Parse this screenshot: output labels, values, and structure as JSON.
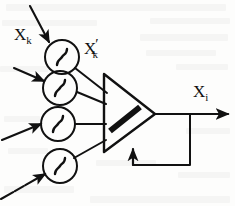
{
  "figure": {
    "kind": "diagram",
    "background_color": "#fdfdfc",
    "ink_color": "#111111"
  },
  "labels": {
    "input_signal": {
      "base": "X",
      "subscript": "k",
      "prime": ""
    },
    "activated_signal": {
      "base": "X",
      "subscript": "k",
      "prime": "′"
    },
    "output_signal": {
      "base": "X",
      "subscript": "i",
      "prime": ""
    }
  },
  "nodes": {
    "sigmoid_blocks": [
      {
        "id": "sigmoid-1",
        "symbol": "∫",
        "cx": 62,
        "cy": 57,
        "r": 17
      },
      {
        "id": "sigmoid-2",
        "symbol": "∫",
        "cx": 60,
        "cy": 88,
        "r": 17
      },
      {
        "id": "sigmoid-3",
        "symbol": "∫",
        "cx": 58,
        "cy": 124,
        "r": 17
      },
      {
        "id": "sigmoid-4",
        "symbol": "∫",
        "cx": 60,
        "cy": 166,
        "r": 17
      }
    ],
    "amplifier": {
      "id": "summing-amplifier",
      "shape": "triangle",
      "apex_x": 155,
      "apex_y": 114,
      "back_x": 104,
      "top_y": 74,
      "bottom_y": 152,
      "gain_bar": true
    },
    "feedback_loop": {
      "id": "feedback-loop",
      "tap_x": 190,
      "tap_y": 114,
      "bottom_y": 165,
      "return_x": 133,
      "arrow_into_y": 152
    },
    "output_line": {
      "from_x": 155,
      "to_x": 232,
      "y": 114
    }
  },
  "input_arrows": [
    {
      "id": "input-arrow-1",
      "x1": 30,
      "y1": 6,
      "x2": 52,
      "y2": 45
    },
    {
      "id": "input-arrow-2",
      "x1": 14,
      "y1": 68,
      "x2": 47,
      "y2": 83
    },
    {
      "id": "input-arrow-3",
      "x1": 2,
      "y1": 139,
      "x2": 44,
      "y2": 123
    },
    {
      "id": "input-arrow-4",
      "x1": 2,
      "y1": 198,
      "x2": 47,
      "y2": 172
    }
  ],
  "connections": [
    {
      "id": "conn-1",
      "from": "sigmoid-1",
      "to": "amplifier-top"
    },
    {
      "id": "conn-2",
      "from": "sigmoid-2",
      "to": "amplifier-upper-mid"
    },
    {
      "id": "conn-3",
      "from": "sigmoid-3",
      "to": "amplifier-lower-mid"
    },
    {
      "id": "conn-4",
      "from": "sigmoid-4",
      "to": "amplifier-bottom"
    }
  ]
}
